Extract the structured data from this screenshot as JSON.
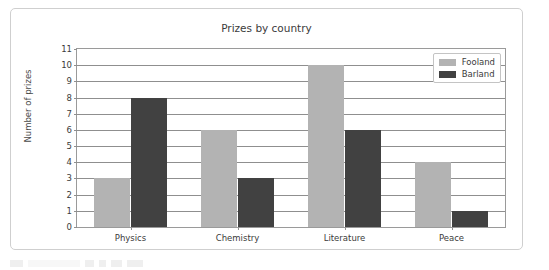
{
  "chart_data": {
    "type": "bar",
    "title": "Prizes by country",
    "xlabel": "",
    "ylabel": "Number of prizes",
    "categories": [
      "Physics",
      "Chemistry",
      "Literature",
      "Peace"
    ],
    "series": [
      {
        "name": "Fooland",
        "color": "#b3b3b3",
        "values": [
          3,
          6,
          10,
          4
        ]
      },
      {
        "name": "Barland",
        "color": "#414141",
        "values": [
          8,
          3,
          6,
          1
        ]
      }
    ],
    "ylim": [
      0,
      11
    ],
    "yticks": [
      0,
      1,
      2,
      3,
      4,
      5,
      6,
      7,
      8,
      9,
      10,
      11
    ],
    "ytick_labels": [
      "0",
      "1",
      "2",
      "3",
      "4",
      "5",
      "6",
      "7",
      "8",
      "9",
      "10",
      "11"
    ],
    "grid": true,
    "legend_position": "top-right"
  },
  "card": {
    "border_color": "#cfcfcf"
  }
}
